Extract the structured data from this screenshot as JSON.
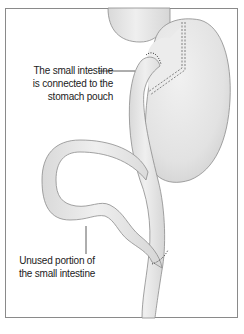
{
  "diagram": {
    "type": "medical-illustration",
    "labels": {
      "stomach_pouch_connection": {
        "line1": "The small intestine",
        "line2": "is connected to the",
        "line3": "stomach pouch"
      },
      "unused_intestine": {
        "line1": "Unused portion of",
        "line2": "the small intestine"
      }
    },
    "colors": {
      "organ_fill": "#e8e8e8",
      "organ_stroke": "#8c8c8c",
      "staple_line": "#555555",
      "frame": "#8a8a8a",
      "text": "#222222"
    }
  }
}
